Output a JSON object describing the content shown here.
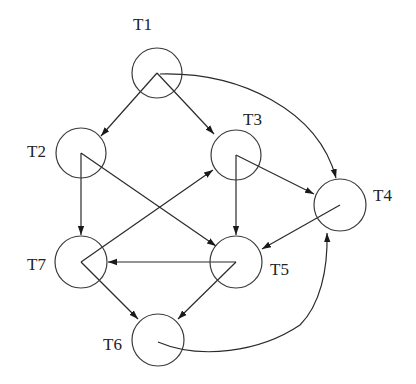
{
  "diagram": {
    "type": "directed-task-graph",
    "colors": {
      "stroke": "#2a2a2a",
      "label": "#222222",
      "background": "#ffffff"
    },
    "nodes": [
      {
        "id": "T1",
        "label": "T1",
        "cx": 157,
        "cy": 73,
        "r": 25,
        "lx": 133,
        "ly": 30
      },
      {
        "id": "T2",
        "label": "T2",
        "cx": 81,
        "cy": 153,
        "r": 25,
        "lx": 27,
        "ly": 157
      },
      {
        "id": "T3",
        "label": "T3",
        "cx": 236,
        "cy": 155,
        "r": 25,
        "lx": 243,
        "ly": 125
      },
      {
        "id": "T4",
        "label": "T4",
        "cx": 340,
        "cy": 205,
        "r": 26,
        "lx": 373,
        "ly": 201
      },
      {
        "id": "T5",
        "label": "T5",
        "cx": 236,
        "cy": 262,
        "r": 26,
        "lx": 270,
        "ly": 275
      },
      {
        "id": "T6",
        "label": "T6",
        "cx": 158,
        "cy": 340,
        "r": 26,
        "lx": 103,
        "ly": 350
      },
      {
        "id": "T7",
        "label": "T7",
        "cx": 81,
        "cy": 262,
        "r": 26,
        "lx": 27,
        "ly": 270
      }
    ],
    "edges": [
      {
        "from": "T1",
        "to": "T2",
        "curved": false
      },
      {
        "from": "T1",
        "to": "T3",
        "curved": false
      },
      {
        "from": "T1",
        "to": "T4",
        "curved": true
      },
      {
        "from": "T2",
        "to": "T7",
        "curved": false
      },
      {
        "from": "T2",
        "to": "T5",
        "curved": false
      },
      {
        "from": "T3",
        "to": "T5",
        "curved": false
      },
      {
        "from": "T3",
        "to": "T4",
        "curved": false
      },
      {
        "from": "T4",
        "to": "T5",
        "curved": false
      },
      {
        "from": "T7",
        "to": "T3",
        "curved": false
      },
      {
        "from": "T7",
        "to": "T6",
        "curved": false
      },
      {
        "from": "T5",
        "to": "T7",
        "curved": false
      },
      {
        "from": "T5",
        "to": "T6",
        "curved": false
      },
      {
        "from": "T6",
        "to": "T4",
        "curved": true
      }
    ]
  }
}
